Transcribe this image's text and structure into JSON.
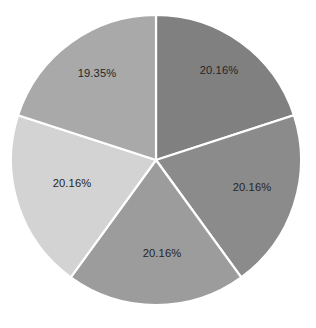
{
  "chart_data": {
    "type": "pie",
    "title": "",
    "subtitle": "",
    "xlabel": "",
    "ylabel": "",
    "legend": "none",
    "grid": false,
    "background_color": "#ffffff",
    "label_color": "#262626",
    "separator_color": "#ffffff",
    "start_angle_deg": 0,
    "direction": "clockwise",
    "center": {
      "x": 156,
      "y": 160
    },
    "radius": 145,
    "categories": [
      "Slice 1",
      "Slice 2",
      "Slice 3",
      "Slice 4",
      "Slice 5"
    ],
    "values": [
      20.16,
      20.16,
      20.16,
      20.16,
      19.35
    ],
    "labels": [
      "20.16%",
      "20.16%",
      "20.16%",
      "20.16%",
      "19.35%"
    ],
    "colors": [
      "#808080",
      "#8b8b8b",
      "#9c9c9c",
      "#d3d3d3",
      "#a9a9a9"
    ],
    "slices": [
      {
        "name": "slice-top-right",
        "label": "20.16%",
        "value": 20.16,
        "color": "#808080",
        "start_deg": 0,
        "end_deg": 72,
        "label_x": 219,
        "label_y": 71
      },
      {
        "name": "slice-right",
        "label": "20.16%",
        "value": 20.16,
        "color": "#8b8b8b",
        "start_deg": 72,
        "end_deg": 144,
        "label_x": 252,
        "label_y": 188
      },
      {
        "name": "slice-bottom",
        "label": "20.16%",
        "value": 20.16,
        "color": "#9c9c9c",
        "start_deg": 144,
        "end_deg": 216,
        "label_x": 162,
        "label_y": 254
      },
      {
        "name": "slice-left",
        "label": "20.16%",
        "value": 20.16,
        "color": "#d3d3d3",
        "start_deg": 216,
        "end_deg": 288,
        "label_x": 72,
        "label_y": 184
      },
      {
        "name": "slice-top-left",
        "label": "19.35%",
        "value": 19.35,
        "color": "#a9a9a9",
        "start_deg": 288,
        "end_deg": 360,
        "label_x": 97,
        "label_y": 74
      }
    ]
  }
}
